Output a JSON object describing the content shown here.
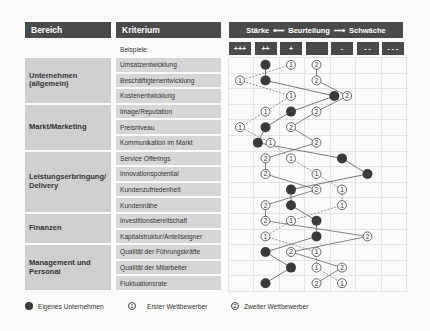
{
  "header": {
    "area_label": "Bereich",
    "criterion_label": "Kriterium",
    "rating": {
      "left": "Stärke",
      "center": "Beurteilung",
      "right": "Schwäche",
      "arrow_left": "⟵",
      "arrow_right": "⟶"
    },
    "examples_label": "Beispiele:",
    "scale": [
      "+++",
      "++",
      "+",
      "",
      "-",
      "- -",
      "- - -"
    ]
  },
  "areas": [
    {
      "label": "Unternehmen (allgemein)",
      "rows": 3
    },
    {
      "label": "Markt/Marketing",
      "rows": 3
    },
    {
      "label": "Leistungserbringung/ Delivery",
      "rows": 4
    },
    {
      "label": "Finanzen",
      "rows": 2
    },
    {
      "label": "Management und Personal",
      "rows": 3
    }
  ],
  "criteria": [
    "Umsatzentwicklung",
    "Beschäftigtenentwicklung",
    "Kostenentwicklung",
    "Image/Reputation",
    "Preisniveau",
    "Kommunikation im Markt",
    "Service Offerings",
    "Innovationspotential",
    "Kundenzufriedenheit",
    "Kundennähe",
    "Investitionsbereitschaft",
    "Kapitalstruktur/Anteilseigner",
    "Qualität der Führungskräfte",
    "Qualität der Mitarbeiter",
    "Fluktuationsrate"
  ],
  "legend": {
    "own": "Eigenes Unternehmen",
    "first": "Erster Wettbewerber",
    "second": "Zweiter Wettbewerber",
    "first_symbol": "1",
    "second_symbol": "2"
  },
  "colors": {
    "header_bg": "#4a4a4a",
    "area_bg": "#cfcfcf",
    "criterion_bg": "#d6d6d6",
    "own_marker": "#3a3a3a",
    "line_own": "#555555",
    "line_first": "#777777",
    "line_second": "#666666"
  },
  "chart_data": {
    "type": "profile",
    "title": "Stärke ⟵ Beurteilung ⟶ Schwäche",
    "scale_positions": [
      "+++",
      "++",
      "+",
      "0",
      "-",
      "--",
      "---"
    ],
    "note": "Values are column positions 1 (+++) to 7 (---), read off the grid",
    "series": [
      {
        "name": "Eigenes Unternehmen",
        "marker": "filled",
        "values": [
          2,
          2,
          4.7,
          3,
          2,
          1.7,
          5,
          6,
          3,
          3,
          4,
          4,
          2,
          3,
          2
        ]
      },
      {
        "name": "Erster Wettbewerber",
        "marker": "1",
        "values": [
          3,
          1,
          3,
          2,
          1,
          2.2,
          3,
          4,
          5,
          5,
          3,
          2,
          4,
          4,
          5
        ]
      },
      {
        "name": "Zweiter Wettbewerber",
        "marker": "2",
        "values": [
          4,
          4,
          5.2,
          4,
          3,
          4,
          2,
          2,
          4,
          2,
          2,
          6,
          3,
          5,
          4
        ]
      }
    ]
  }
}
